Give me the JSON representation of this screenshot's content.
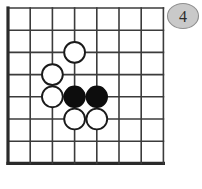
{
  "diagram": {
    "kind": "go-board-diagram",
    "label_badge": "4",
    "badge_color": "#c9c9c9",
    "black_color": "#0d0d0d",
    "white_color": "#ffffff",
    "line_color": "#3b3b3b",
    "board": {
      "columns": 8,
      "rows": 8,
      "origin_x": 8,
      "origin_y": 8,
      "spacing": 22.2,
      "edge_left": true,
      "edge_bottom": true
    },
    "stones": [
      {
        "color": "white",
        "col": 3,
        "row": 2,
        "label": "white-stone-c3"
      },
      {
        "color": "white",
        "col": 2,
        "row": 3,
        "label": "white-stone-b4"
      },
      {
        "color": "white",
        "col": 2,
        "row": 4,
        "label": "white-stone-b5"
      },
      {
        "color": "black",
        "col": 3,
        "row": 4,
        "label": "black-stone-c5"
      },
      {
        "color": "black",
        "col": 4,
        "row": 4,
        "label": "black-stone-d5"
      },
      {
        "color": "white",
        "col": 3,
        "row": 5,
        "label": "white-stone-c6"
      },
      {
        "color": "white",
        "col": 4,
        "row": 5,
        "label": "white-stone-d6"
      }
    ],
    "counts": {
      "black_stones": 2,
      "white_stones": 5,
      "total_stones": 7
    }
  }
}
